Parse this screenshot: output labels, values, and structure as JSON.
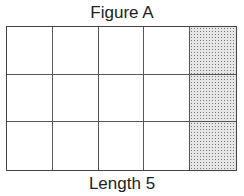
{
  "figure": {
    "title": "Figure A",
    "caption": "Length 5",
    "grid": {
      "columns": 5,
      "rows": 3,
      "shaded_column_index": 4,
      "shading": "dotted stipple"
    }
  }
}
